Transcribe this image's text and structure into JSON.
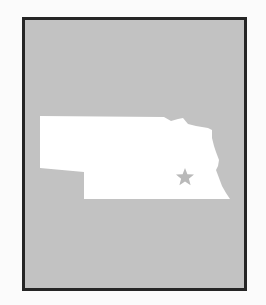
{
  "map": {
    "region": "Nebraska",
    "marker": {
      "type": "star",
      "label": "Lincoln"
    },
    "colors": {
      "background": "#fbfbfb",
      "frame_border": "#252525",
      "frame_fill": "#c2c2c2",
      "state_fill": "#ffffff",
      "star": "#b9b9b9"
    }
  }
}
